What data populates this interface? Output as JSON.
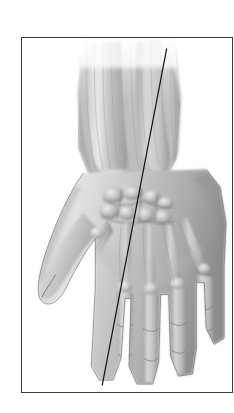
{
  "figure": {
    "title": "Anatomical illustration of the dorsum of the left hand and distal forearm",
    "technique": "grayscale pencil / halftone engraving",
    "background_color": "#ffffff",
    "frame": {
      "name": "plate-border",
      "stroke_color": "#3a3a3a",
      "stroke_width_px": 1.5,
      "x": 21,
      "y": 37,
      "width": 212,
      "height": 356,
      "fill": "#ffffff"
    },
    "reference_line": {
      "name": "oblique-axis-line",
      "description": "thin straight diagonal reference line crossing the plate from upper right to lower left",
      "color": "#111111",
      "width_px": 1.2,
      "x1": 167,
      "y1": 48,
      "x2": 102,
      "y2": 386
    },
    "illustration_bounds": {
      "x": 40,
      "y": 40,
      "width": 145,
      "height": 348
    },
    "tones": {
      "lightest": "#f4f4f4",
      "light": "#dcdcdc",
      "mid": "#b3b3b3",
      "mid_dark": "#8d8d8d",
      "dark": "#6a6a6a",
      "darkest": "#3f3f3f",
      "outline": "#5a5a5a"
    },
    "anatomy_parts": [
      {
        "name": "radius-shaft",
        "label": "Radius"
      },
      {
        "name": "ulna-shaft",
        "label": "Ulna"
      },
      {
        "name": "ulnar-styloid-process",
        "label": "Styloid process of ulna"
      },
      {
        "name": "radial-styloid-process",
        "label": "Styloid process of radius"
      },
      {
        "name": "carpal-bones",
        "label": "Carpus"
      },
      {
        "name": "metacarpal-bones",
        "label": "Metacarpals I-V"
      },
      {
        "name": "proximal-phalanges",
        "label": "Proximal phalanges"
      },
      {
        "name": "middle-phalanges",
        "label": "Middle phalanges"
      },
      {
        "name": "distal-phalanges",
        "label": "Distal phalanges"
      },
      {
        "name": "thumb",
        "label": "Pollex"
      },
      {
        "name": "index-finger",
        "label": "Index finger"
      },
      {
        "name": "middle-finger",
        "label": "Middle finger"
      },
      {
        "name": "ring-finger",
        "label": "Ring finger"
      },
      {
        "name": "little-finger",
        "label": "Little finger"
      }
    ]
  }
}
